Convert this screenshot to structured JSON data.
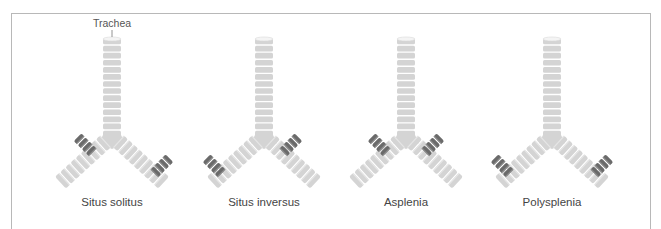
{
  "figure": {
    "annotation": "Trachea",
    "panels": [
      {
        "label": "Situs solitus",
        "cx": 112,
        "left_dark": "early",
        "right_dark": "late"
      },
      {
        "label": "Situs inversus",
        "cx": 264,
        "left_dark": "late",
        "right_dark": "early"
      },
      {
        "label": "Asplenia",
        "cx": 406,
        "left_dark": "early",
        "right_dark": "early"
      },
      {
        "label": "Polysplenia",
        "cx": 552,
        "left_dark": "late",
        "right_dark": "late"
      }
    ],
    "colors": {
      "ring_light": "#d4d4d4",
      "ring_gap": "#f2f2f2",
      "ring_dark": "#6a6a6a",
      "border": "#b8b8b8",
      "text": "#444444"
    }
  }
}
